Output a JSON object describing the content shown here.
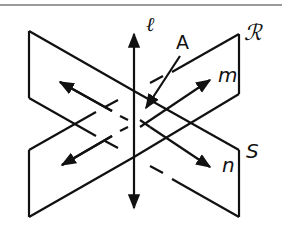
{
  "figure": {
    "labels": {
      "line_l": "ℓ",
      "point_a": "A",
      "plane_r": "ℛ",
      "line_m": "m",
      "plane_s": "S",
      "line_n": "n"
    },
    "colors": {
      "stroke": "#111111",
      "rule": "#9a9a9a",
      "background": "#ffffff"
    }
  }
}
